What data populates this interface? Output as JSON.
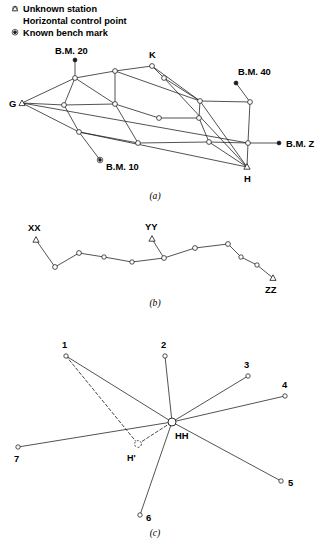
{
  "legend": {
    "items": [
      {
        "symbol": "open-circle-icon",
        "label": "Unknown station"
      },
      {
        "symbol": "open-triangle-icon",
        "label": "Horizontal control point"
      },
      {
        "symbol": "filled-ringed-dot-icon",
        "label": "Known bench mark"
      }
    ]
  },
  "captions": {
    "a": "(a)",
    "b": "(b)",
    "c": "(c)"
  },
  "panel_a": {
    "name": "triangulation-network",
    "labels": {
      "bm20": "B.M. 20",
      "bm40": "B.M. 40",
      "bm10": "B.M. 10",
      "bmz": "B.M. Z",
      "g": "G",
      "k": "K",
      "h": "H"
    },
    "control_points": [
      {
        "id": "G",
        "x": 22,
        "y": 103
      },
      {
        "id": "H",
        "x": 247,
        "y": 167
      }
    ],
    "bench_marks": [
      {
        "id": "BM20",
        "x": 75,
        "y": 60
      },
      {
        "id": "BM40",
        "x": 236,
        "y": 83
      },
      {
        "id": "BM10",
        "x": 100,
        "y": 160
      },
      {
        "id": "BMZ",
        "x": 279,
        "y": 143
      }
    ],
    "stations": [
      {
        "id": "s1",
        "x": 75,
        "y": 78
      },
      {
        "id": "s2",
        "x": 115,
        "y": 71
      },
      {
        "id": "s3",
        "x": 152,
        "y": 66
      },
      {
        "id": "s4",
        "x": 164,
        "y": 78
      },
      {
        "id": "s5",
        "x": 200,
        "y": 101
      },
      {
        "id": "s6",
        "x": 250,
        "y": 102
      },
      {
        "id": "s7",
        "x": 64,
        "y": 105
      },
      {
        "id": "s8",
        "x": 115,
        "y": 104
      },
      {
        "id": "s9",
        "x": 159,
        "y": 118
      },
      {
        "id": "s10",
        "x": 199,
        "y": 118
      },
      {
        "id": "s11",
        "x": 79,
        "y": 132
      },
      {
        "id": "s12",
        "x": 138,
        "y": 143
      },
      {
        "id": "s13",
        "x": 209,
        "y": 142
      },
      {
        "id": "s14",
        "x": 248,
        "y": 143
      }
    ],
    "edges": [
      [
        "BM20",
        "s1"
      ],
      [
        "BM40",
        "s6"
      ],
      [
        "BMZ",
        "s14"
      ],
      [
        "s11",
        "BM10"
      ],
      [
        "G",
        "s1"
      ],
      [
        "G",
        "s7"
      ],
      [
        "G",
        "s11"
      ],
      [
        "G",
        "s14"
      ],
      [
        "s1",
        "s2"
      ],
      [
        "s1",
        "s7"
      ],
      [
        "s1",
        "s8"
      ],
      [
        "s2",
        "s3"
      ],
      [
        "s2",
        "s8"
      ],
      [
        "s2",
        "s5"
      ],
      [
        "s3",
        "s4"
      ],
      [
        "s3",
        "s5"
      ],
      [
        "s4",
        "s5"
      ],
      [
        "s4",
        "H"
      ],
      [
        "s5",
        "s6"
      ],
      [
        "s5",
        "s10"
      ],
      [
        "s5",
        "H"
      ],
      [
        "s6",
        "s14"
      ],
      [
        "s7",
        "s8"
      ],
      [
        "s7",
        "s11"
      ],
      [
        "s8",
        "s9"
      ],
      [
        "s8",
        "s12"
      ],
      [
        "s9",
        "s10"
      ],
      [
        "s10",
        "s13"
      ],
      [
        "s11",
        "s12"
      ],
      [
        "s11",
        "H"
      ],
      [
        "s12",
        "s13"
      ],
      [
        "s13",
        "s14"
      ],
      [
        "s13",
        "H"
      ],
      [
        "s14",
        "H"
      ]
    ]
  },
  "panel_b": {
    "name": "open-traverse",
    "labels": {
      "xx": "XX",
      "yy": "YY",
      "zz": "ZZ"
    },
    "control_points": [
      {
        "id": "XX",
        "x": 36,
        "y": 240
      },
      {
        "id": "YY",
        "x": 152,
        "y": 239
      },
      {
        "id": "ZZ",
        "x": 273,
        "y": 278
      }
    ],
    "stations": [
      {
        "id": "t1",
        "x": 55,
        "y": 267
      },
      {
        "id": "t2",
        "x": 79,
        "y": 253
      },
      {
        "id": "t3",
        "x": 104,
        "y": 257
      },
      {
        "id": "t4",
        "x": 132,
        "y": 262
      },
      {
        "id": "t5",
        "x": 164,
        "y": 258
      },
      {
        "id": "t6",
        "x": 195,
        "y": 248
      },
      {
        "id": "t7",
        "x": 228,
        "y": 244
      },
      {
        "id": "t8",
        "x": 241,
        "y": 257
      },
      {
        "id": "t9",
        "x": 257,
        "y": 265
      }
    ],
    "edges": [
      [
        "XX",
        "t1"
      ],
      [
        "t1",
        "t2"
      ],
      [
        "t2",
        "t3"
      ],
      [
        "t3",
        "t4"
      ],
      [
        "t4",
        "t5"
      ],
      [
        "YY",
        "t5"
      ],
      [
        "t5",
        "t6"
      ],
      [
        "t6",
        "t7"
      ],
      [
        "t7",
        "t8"
      ],
      [
        "t8",
        "t9"
      ],
      [
        "t9",
        "ZZ"
      ]
    ]
  },
  "panel_c": {
    "name": "radial-network",
    "labels": {
      "n1": "1",
      "n2": "2",
      "n3": "3",
      "n4": "4",
      "n5": "5",
      "n6": "6",
      "n7": "7",
      "hh": "HH",
      "hprime": "H'"
    },
    "hub": {
      "id": "HH",
      "x": 172,
      "y": 422
    },
    "ghost": {
      "id": "Hprime",
      "x": 138,
      "y": 444
    },
    "stations": [
      {
        "id": "1",
        "x": 66,
        "y": 356
      },
      {
        "id": "2",
        "x": 165,
        "y": 356
      },
      {
        "id": "3",
        "x": 248,
        "y": 376
      },
      {
        "id": "4",
        "x": 285,
        "y": 396
      },
      {
        "id": "5",
        "x": 281,
        "y": 481
      },
      {
        "id": "6",
        "x": 140,
        "y": 515
      },
      {
        "id": "7",
        "x": 18,
        "y": 447
      }
    ],
    "edges": [
      [
        "1",
        "HH"
      ],
      [
        "2",
        "HH"
      ],
      [
        "3",
        "HH"
      ],
      [
        "4",
        "HH"
      ],
      [
        "5",
        "HH"
      ],
      [
        "6",
        "HH"
      ],
      [
        "7",
        "HH"
      ]
    ],
    "dashed_edges": [
      [
        "1",
        "Hprime"
      ],
      [
        "Hprime",
        "HH"
      ]
    ]
  }
}
